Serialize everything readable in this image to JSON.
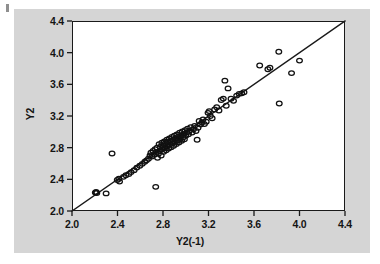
{
  "figure": {
    "background_color": "#d5d5d5",
    "plot_background_color": "#ffffff",
    "axis_color": "#1a1a1a",
    "marker_color": "#111111",
    "page_background": "#ffffff"
  },
  "axis_titles": {
    "x": "Y2(-1)",
    "y": "Y2"
  },
  "chart_data": {
    "type": "scatter",
    "title": "",
    "subtitle": "",
    "xlabel": "Y2(-1)",
    "ylabel": "Y2",
    "xlim": [
      2.0,
      4.4
    ],
    "ylim": [
      2.0,
      4.4
    ],
    "xticks": [
      2.0,
      2.4,
      2.8,
      3.2,
      3.6,
      4.0,
      4.4
    ],
    "yticks": [
      2.0,
      2.4,
      2.8,
      3.2,
      3.6,
      4.0,
      4.4
    ],
    "xticklabels": [
      "2.0",
      "2.4",
      "2.8",
      "3.2",
      "3.6",
      "4.0",
      "4.4"
    ],
    "yticklabels": [
      "2.0",
      "2.4",
      "2.8",
      "3.2",
      "3.6",
      "4.0",
      "4.4"
    ],
    "grid": false,
    "legend": null,
    "marker": "open-circle",
    "marker_size": 4.6,
    "reference_line": {
      "name": "identity-line",
      "type": "line",
      "label": "y = x",
      "x": [
        2.0,
        4.4
      ],
      "y": [
        2.0,
        4.4
      ]
    },
    "series": [
      {
        "name": "Y2 vs Y2(-1)",
        "points": [
          [
            2.205,
            2.233
          ],
          [
            2.218,
            2.228
          ],
          [
            2.212,
            2.24
          ],
          [
            2.3,
            2.222
          ],
          [
            2.352,
            2.727
          ],
          [
            2.398,
            2.392
          ],
          [
            2.412,
            2.408
          ],
          [
            2.418,
            2.372
          ],
          [
            2.452,
            2.432
          ],
          [
            2.474,
            2.452
          ],
          [
            2.5,
            2.468
          ],
          [
            2.52,
            2.492
          ],
          [
            2.546,
            2.516
          ],
          [
            2.57,
            2.548
          ],
          [
            2.596,
            2.572
          ],
          [
            2.618,
            2.596
          ],
          [
            2.64,
            2.622
          ],
          [
            2.655,
            2.64
          ],
          [
            2.672,
            2.66
          ],
          [
            2.686,
            2.702
          ],
          [
            2.694,
            2.736
          ],
          [
            2.702,
            2.688
          ],
          [
            2.712,
            2.76
          ],
          [
            2.724,
            2.712
          ],
          [
            2.73,
            2.782
          ],
          [
            2.736,
            2.305
          ],
          [
            2.74,
            2.744
          ],
          [
            2.748,
            2.8
          ],
          [
            2.752,
            2.672
          ],
          [
            2.76,
            2.724
          ],
          [
            2.766,
            2.845
          ],
          [
            2.772,
            2.76
          ],
          [
            2.778,
            2.812
          ],
          [
            2.784,
            2.7
          ],
          [
            2.79,
            2.862
          ],
          [
            2.794,
            2.78
          ],
          [
            2.8,
            2.832
          ],
          [
            2.806,
            2.748
          ],
          [
            2.812,
            2.88
          ],
          [
            2.816,
            2.796
          ],
          [
            2.822,
            2.856
          ],
          [
            2.828,
            2.768
          ],
          [
            2.834,
            2.9
          ],
          [
            2.838,
            2.818
          ],
          [
            2.844,
            2.872
          ],
          [
            2.85,
            2.79
          ],
          [
            2.856,
            2.918
          ],
          [
            2.86,
            2.838
          ],
          [
            2.866,
            2.888
          ],
          [
            2.872,
            2.806
          ],
          [
            2.878,
            2.935
          ],
          [
            2.884,
            2.858
          ],
          [
            2.888,
            2.902
          ],
          [
            2.894,
            2.824
          ],
          [
            2.9,
            2.95
          ],
          [
            2.906,
            2.874
          ],
          [
            2.912,
            2.92
          ],
          [
            2.918,
            2.845
          ],
          [
            2.922,
            2.968
          ],
          [
            2.928,
            2.892
          ],
          [
            2.934,
            2.938
          ],
          [
            2.94,
            2.866
          ],
          [
            2.946,
            2.988
          ],
          [
            2.952,
            2.91
          ],
          [
            2.958,
            2.956
          ],
          [
            2.964,
            2.886
          ],
          [
            2.97,
            3.005
          ],
          [
            2.976,
            2.93
          ],
          [
            2.982,
            2.974
          ],
          [
            2.988,
            2.906
          ],
          [
            2.994,
            3.022
          ],
          [
            3.0,
            2.95
          ],
          [
            3.008,
            2.992
          ],
          [
            3.016,
            3.04
          ],
          [
            3.024,
            2.97
          ],
          [
            3.032,
            3.012
          ],
          [
            3.044,
            3.058
          ],
          [
            3.056,
            2.992
          ],
          [
            3.068,
            3.032
          ],
          [
            3.078,
            3.076
          ],
          [
            3.09,
            3.01
          ],
          [
            3.1,
            2.9
          ],
          [
            3.108,
            3.052
          ],
          [
            3.118,
            3.138
          ],
          [
            3.13,
            3.092
          ],
          [
            3.142,
            3.118
          ],
          [
            3.152,
            3.156
          ],
          [
            3.164,
            3.098
          ],
          [
            3.18,
            3.128
          ],
          [
            3.196,
            3.24
          ],
          [
            3.206,
            3.262
          ],
          [
            3.216,
            3.2
          ],
          [
            3.232,
            3.172
          ],
          [
            3.254,
            3.282
          ],
          [
            3.272,
            3.312
          ],
          [
            3.292,
            3.27
          ],
          [
            3.312,
            3.402
          ],
          [
            3.33,
            3.42
          ],
          [
            3.344,
            3.646
          ],
          [
            3.356,
            3.33
          ],
          [
            3.372,
            3.548
          ],
          [
            3.398,
            3.418
          ],
          [
            3.42,
            3.392
          ],
          [
            3.448,
            3.458
          ],
          [
            3.47,
            3.48
          ],
          [
            3.492,
            3.486
          ],
          [
            3.512,
            3.5
          ],
          [
            3.65,
            3.838
          ],
          [
            3.722,
            3.79
          ],
          [
            3.74,
            3.81
          ],
          [
            3.818,
            4.012
          ],
          [
            3.822,
            3.358
          ],
          [
            3.93,
            3.742
          ],
          [
            4.0,
            3.9
          ]
        ]
      }
    ]
  }
}
